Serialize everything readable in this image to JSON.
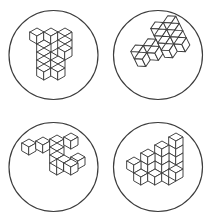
{
  "canvas": {
    "width": 214,
    "height": 223,
    "background_color": "#ffffff",
    "stroke_color": "#3c3c3c",
    "fill_color": "#ffffff"
  },
  "grid": {
    "columns": 2,
    "rows": 2,
    "panel_count": 4
  },
  "panels": [
    {
      "id": "panel-1",
      "position": "top-left",
      "center_x": 57,
      "center_y": 55,
      "circle_radius": 45,
      "figure_name": "block-figure-f-shape",
      "figure_label": "F-shaped block figure",
      "orientation_label": "upright",
      "cube_count": 11,
      "projection": "isometric",
      "rotation_deg": 0,
      "cubes": [
        [
          0,
          2,
          0
        ],
        [
          1,
          2,
          0
        ],
        [
          2,
          2,
          0
        ],
        [
          0,
          1,
          0
        ],
        [
          2,
          1,
          0
        ],
        [
          0,
          0,
          0
        ],
        [
          1,
          0,
          0
        ],
        [
          2,
          0,
          0
        ],
        [
          0,
          -1,
          0
        ],
        [
          0,
          -2,
          0
        ],
        [
          1,
          -2,
          0
        ]
      ]
    },
    {
      "id": "panel-2",
      "position": "top-right",
      "center_x": 158,
      "center_y": 55,
      "circle_radius": 45,
      "figure_name": "block-figure-l-shape-tilted",
      "figure_label": "L-shaped block figure, tilted",
      "orientation_label": "rotated clockwise",
      "cube_count": 12,
      "projection": "isometric",
      "rotation_deg": -28,
      "cubes": [
        [
          0,
          0,
          0
        ],
        [
          1,
          0,
          0
        ],
        [
          2,
          0,
          0
        ],
        [
          3,
          0,
          0
        ],
        [
          2,
          1,
          0
        ],
        [
          3,
          1,
          0
        ],
        [
          2,
          2,
          0
        ],
        [
          3,
          2,
          0
        ],
        [
          0,
          1,
          0
        ],
        [
          1,
          1,
          0
        ],
        [
          2,
          -1,
          0
        ],
        [
          3,
          -1,
          0
        ]
      ]
    },
    {
      "id": "panel-3",
      "position": "bottom-left",
      "center_x": 57,
      "center_y": 167,
      "circle_radius": 45,
      "figure_name": "block-figure-z-shape",
      "figure_label": "Z-shaped block figure",
      "orientation_label": "angled with descending arm",
      "cube_count": 10,
      "projection": "isometric",
      "rotation_deg": 12,
      "cubes": [
        [
          0,
          0,
          0
        ],
        [
          1,
          0,
          0
        ],
        [
          2,
          0,
          0
        ],
        [
          3,
          0,
          0
        ],
        [
          3,
          -1,
          0
        ],
        [
          3,
          -2,
          0
        ],
        [
          3,
          -2,
          1
        ],
        [
          4,
          -2,
          1
        ],
        [
          5,
          -2,
          1
        ],
        [
          6,
          -2,
          1
        ]
      ]
    },
    {
      "id": "panel-4",
      "position": "bottom-right",
      "center_x": 158,
      "center_y": 167,
      "circle_radius": 45,
      "figure_name": "block-figure-staircase",
      "figure_label": "Staircase block figure",
      "orientation_label": "stepped wedge",
      "cube_count": 14,
      "projection": "isometric",
      "rotation_deg": 0,
      "cubes": [
        [
          0,
          0,
          0
        ],
        [
          1,
          0,
          0
        ],
        [
          2,
          0,
          0
        ],
        [
          3,
          0,
          0
        ],
        [
          1,
          1,
          0
        ],
        [
          2,
          1,
          0
        ],
        [
          3,
          1,
          0
        ],
        [
          2,
          2,
          0
        ],
        [
          3,
          2,
          0
        ],
        [
          3,
          3,
          0
        ],
        [
          0,
          0,
          1
        ],
        [
          1,
          0,
          1
        ],
        [
          2,
          0,
          1
        ],
        [
          3,
          0,
          1
        ]
      ]
    }
  ]
}
